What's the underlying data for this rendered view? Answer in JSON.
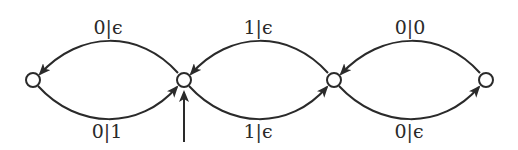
{
  "diagram": {
    "type": "state-transition-graph",
    "nodes": [
      {
        "id": "q0",
        "x": 33,
        "y": 80
      },
      {
        "id": "q1",
        "x": 184,
        "y": 80,
        "initial": true
      },
      {
        "id": "q2",
        "x": 334,
        "y": 80
      },
      {
        "id": "q3",
        "x": 486,
        "y": 80
      }
    ],
    "edges": [
      {
        "from": "q1",
        "to": "q0",
        "label": "0|ϵ",
        "position": "top"
      },
      {
        "from": "q0",
        "to": "q1",
        "label": "0|1",
        "position": "bottom"
      },
      {
        "from": "q2",
        "to": "q1",
        "label": "1|ϵ",
        "position": "top"
      },
      {
        "from": "q1",
        "to": "q2",
        "label": "1|ϵ",
        "position": "bottom"
      },
      {
        "from": "q3",
        "to": "q2",
        "label": "0|0",
        "position": "top"
      },
      {
        "from": "q2",
        "to": "q3",
        "label": "0|ϵ",
        "position": "bottom"
      }
    ],
    "labels": {
      "e_q1_q0": "0|ϵ",
      "e_q0_q1": "0|1",
      "e_q2_q1": "1|ϵ",
      "e_q1_q2": "1|ϵ",
      "e_q3_q2": "0|0",
      "e_q2_q3": "0|ϵ"
    },
    "colors": {
      "stroke": "#2a2a2a",
      "background": "#ffffff"
    }
  }
}
